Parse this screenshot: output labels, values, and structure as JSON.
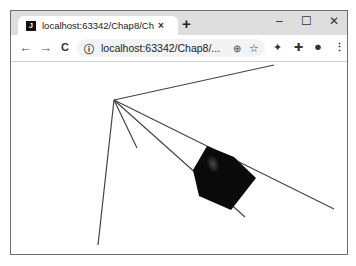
{
  "browser": {
    "tab": {
      "favicon": "jetbrains-icon",
      "title": "localhost:63342/Chap8/Chap8",
      "close": "×"
    },
    "new_tab": "+",
    "window_controls": {
      "minimize": "–",
      "maximize": "☐",
      "close": "✕"
    },
    "toolbar": {
      "back": "←",
      "forward": "→",
      "reload": "C",
      "info": "ⓘ",
      "url": "localhost:63342/Chap8/...",
      "zoom_icon": "⊕",
      "star_icon": "☆",
      "extension1": "✦",
      "extensions": "✚",
      "profile": "●",
      "menu": "⋮"
    }
  },
  "scene": {
    "apex": [
      114,
      100
    ],
    "rays": [
      {
        "end": [
          274,
          65
        ]
      },
      {
        "end": [
          98,
          245
        ]
      },
      {
        "end": [
          137,
          148
        ]
      },
      {
        "end": [
          245,
          217
        ]
      },
      {
        "end": [
          334,
          209
        ]
      }
    ],
    "polygon": [
      [
        207,
        146
      ],
      [
        234,
        157
      ],
      [
        256,
        178
      ],
      [
        231,
        210
      ],
      [
        199,
        196
      ],
      [
        193,
        170
      ]
    ],
    "polygon_color": "#0a0a0a",
    "highlight_color": "#555555",
    "line_color": "#444444"
  }
}
